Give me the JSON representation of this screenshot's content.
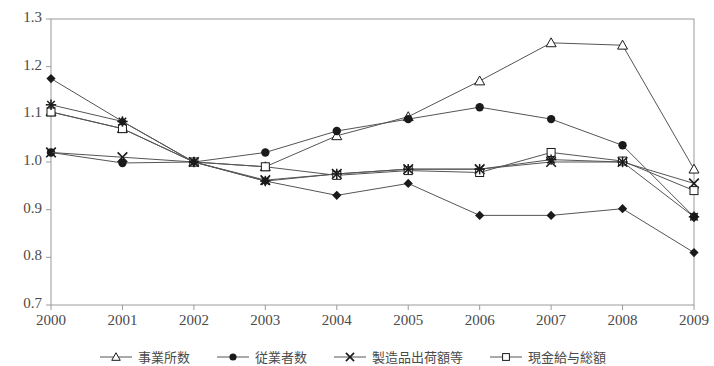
{
  "chart_data": {
    "type": "line",
    "title": "",
    "subtitle": "",
    "xlabel": "",
    "ylabel": "",
    "x": [
      "2000",
      "2001",
      "2002",
      "2003",
      "2004",
      "2005",
      "2006",
      "2007",
      "2008",
      "2009"
    ],
    "xlim": [
      2000,
      2009
    ],
    "ylim": [
      0.7,
      1.3
    ],
    "yticks": [
      "0.7",
      "0.8",
      "0.9",
      "1.0",
      "1.1",
      "1.2",
      "1.3"
    ],
    "grid": false,
    "legend_position": "bottom",
    "series": [
      {
        "name": "事業所数",
        "marker": "triangle-open",
        "values": [
          1.105,
          1.07,
          1.0,
          0.99,
          1.055,
          1.095,
          1.17,
          1.25,
          1.245,
          0.985
        ]
      },
      {
        "name": "従業者数",
        "marker": "circle-filled",
        "values": [
          1.02,
          0.998,
          1.0,
          1.02,
          1.065,
          1.09,
          1.115,
          1.09,
          1.035,
          0.885
        ]
      },
      {
        "name": "製造品出荷額等",
        "marker": "x",
        "values": [
          1.02,
          1.01,
          1.0,
          0.962,
          0.975,
          0.985,
          0.985,
          1.0,
          1.0,
          0.955
        ]
      },
      {
        "name": "現金給与総額",
        "marker": "square-open",
        "values": [
          1.105,
          1.07,
          1.0,
          0.99,
          0.972,
          0.982,
          0.978,
          1.02,
          1.002,
          0.94
        ]
      },
      {
        "name": "",
        "marker": "asterisk",
        "values": [
          1.12,
          1.085,
          1.0,
          0.96,
          0.975,
          0.985,
          0.985,
          1.005,
          1.0,
          0.885
        ]
      },
      {
        "name": "",
        "marker": "diamond-filled",
        "values": [
          1.175,
          1.085,
          1.0,
          0.96,
          0.93,
          0.955,
          0.888,
          0.888,
          0.902,
          0.81
        ]
      }
    ],
    "legend_entries": [
      {
        "label": "事業所数",
        "marker": "triangle-open"
      },
      {
        "label": "従業者数",
        "marker": "circle-filled"
      },
      {
        "label": "製造品出荷額等",
        "marker": "x"
      },
      {
        "label": "現金給与総額",
        "marker": "square-open"
      }
    ],
    "colors": {
      "line": "#555555",
      "marker_fill": "#1a1a1a",
      "marker_open_fill": "#ffffff",
      "axis": "#9a9a9a",
      "text": "#4a4a4a"
    }
  }
}
